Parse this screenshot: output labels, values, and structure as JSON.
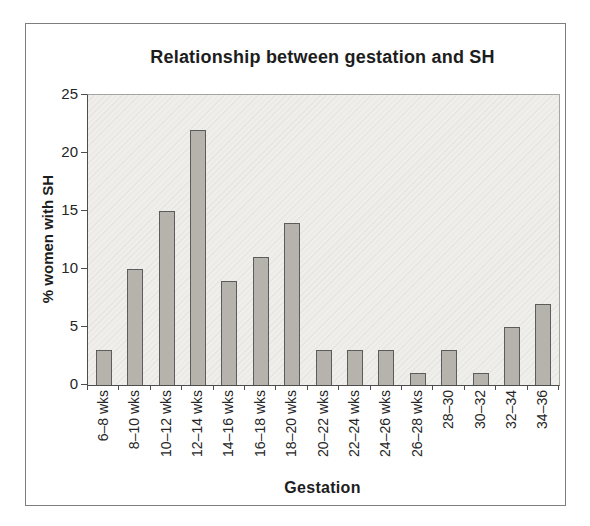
{
  "chart_data": {
    "type": "bar",
    "title": "Relationship between gestation and SH",
    "xlabel": "Gestation",
    "ylabel": "% women with SH",
    "categories": [
      "6–8 wks",
      "8–10 wks",
      "10–12 wks",
      "12–14 wks",
      "14–16 wks",
      "16–18 wks",
      "18–20 wks",
      "20–22 wks",
      "22–24 wks",
      "24–26 wks",
      "26–28 wks",
      "28–30",
      "30–32",
      "32–34",
      "34–36"
    ],
    "values": [
      3,
      10,
      15,
      22,
      9,
      11,
      14,
      3,
      3,
      3,
      1,
      3,
      1,
      5,
      7
    ],
    "ylim": [
      0,
      25
    ],
    "yticks": [
      0,
      5,
      10,
      15,
      20,
      25
    ],
    "grid": false,
    "legend": null,
    "colors": {
      "bar_fill": "#b6b3ad",
      "bar_border": "#5c5c5c",
      "plot_background": "#f0eeeb",
      "frame_border": "#7e7e7e",
      "axis": "#4d4d4d",
      "text": "#1d1d1d"
    }
  }
}
